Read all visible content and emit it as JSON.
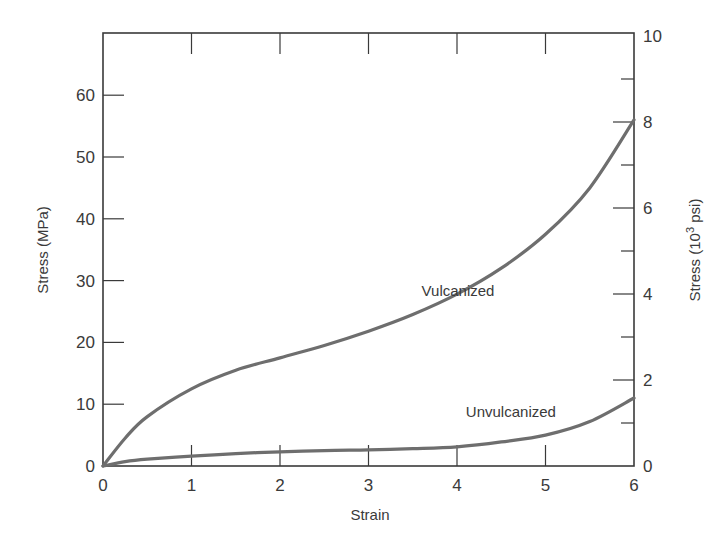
{
  "chart_data": {
    "type": "line",
    "title": "",
    "xlabel": "Strain",
    "ylabel": "Stress (MPa)",
    "ylabel_right": "Stress (10^3 psi)",
    "ylabel_right_parts": {
      "prefix": "Stress (10",
      "sup": "3",
      "suffix": " psi)"
    },
    "xlim": [
      0,
      6
    ],
    "ylim": [
      0,
      70
    ],
    "ylim_right": [
      0,
      10
    ],
    "x_ticks": [
      0,
      1,
      2,
      3,
      4,
      5,
      6
    ],
    "y_ticks_left": [
      0,
      10,
      20,
      30,
      40,
      50,
      60
    ],
    "y_ticks_right_labeled": [
      0,
      2,
      4,
      6,
      8,
      10
    ],
    "y_ticks_right_minor": [
      1,
      3,
      5,
      7,
      9
    ],
    "grid": false,
    "legend": "none (direct annotations)",
    "series": [
      {
        "name": "Vulcanized",
        "x": [
          0,
          0.25,
          0.5,
          1,
          1.5,
          2,
          2.5,
          3,
          3.5,
          4,
          4.5,
          5,
          5.5,
          6
        ],
        "values": [
          0,
          4.5,
          8,
          12.5,
          15.5,
          17.5,
          19.5,
          21.8,
          24.5,
          27.8,
          32,
          37.5,
          45,
          56
        ]
      },
      {
        "name": "Unvulcanized",
        "x": [
          0,
          0.25,
          0.5,
          1,
          1.5,
          2,
          2.5,
          3,
          3.5,
          4,
          4.5,
          5,
          5.5,
          6
        ],
        "values": [
          0,
          0.7,
          1.1,
          1.6,
          2.0,
          2.3,
          2.5,
          2.6,
          2.8,
          3.1,
          3.9,
          5.0,
          7.2,
          11
        ]
      }
    ],
    "annotations": [
      {
        "text": "Vulcanized",
        "x": 3.6,
        "y": 27.5
      },
      {
        "text": "Unvulcanized",
        "x": 4.1,
        "y": 8
      }
    ]
  }
}
